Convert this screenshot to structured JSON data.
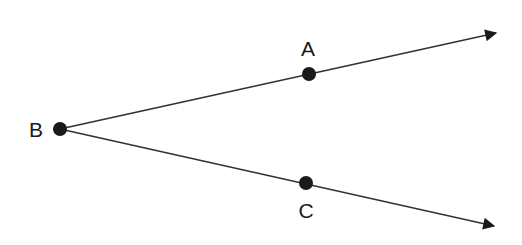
{
  "diagram": {
    "vertex": {
      "label": "B",
      "x": 60,
      "y": 129,
      "label_x": 36,
      "label_y": 137
    },
    "points": [
      {
        "label": "A",
        "x": 309,
        "y": 74,
        "label_x": 308,
        "label_y": 56
      },
      {
        "label": "C",
        "x": 306,
        "y": 183,
        "label_x": 306,
        "label_y": 218
      }
    ],
    "rays": [
      {
        "name": "ray-BA",
        "from": "B",
        "through": "A",
        "tip_x": 498,
        "tip_y": 33
      },
      {
        "name": "ray-BC",
        "from": "B",
        "through": "C",
        "tip_x": 496,
        "tip_y": 226
      }
    ],
    "colors": {
      "line": "#333333",
      "point": "#1a1a1a",
      "text": "#1a1a1a"
    }
  }
}
